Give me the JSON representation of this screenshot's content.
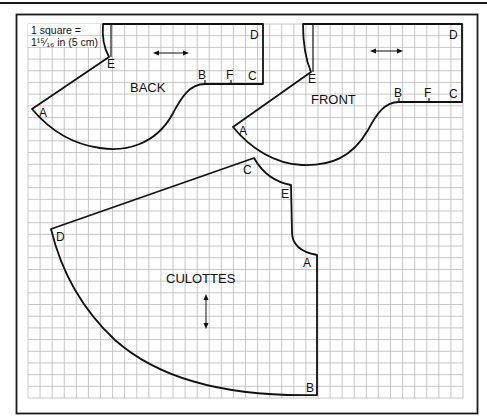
{
  "scale_note": {
    "line1": "1 square =",
    "line2": "1¹⁵⁄₁₆ in (5 cm)"
  },
  "grid": {
    "x0": 28,
    "y0": 24,
    "x1": 463,
    "y1": 398,
    "cols": 36,
    "rows": 32,
    "line_color": "#b9b9b9"
  },
  "pieces": {
    "back": {
      "name": "BACK",
      "points": {
        "A": "A",
        "B": "B",
        "C": "C",
        "D": "D",
        "E": "E",
        "F": "F"
      },
      "grain_arrow": "horizontal"
    },
    "front": {
      "name": "FRONT",
      "points": {
        "A": "A",
        "B": "B",
        "C": "C",
        "D": "D",
        "E": "E",
        "F": "F"
      },
      "grain_arrow": "horizontal"
    },
    "culottes": {
      "name": "CULOTTES",
      "points": {
        "A": "A",
        "B": "B",
        "C": "C",
        "D": "D",
        "E": "E"
      },
      "grain_arrow": "vertical"
    }
  },
  "colors": {
    "outline": "#111111",
    "grid": "#b9b9b9",
    "background": "#ffffff"
  }
}
